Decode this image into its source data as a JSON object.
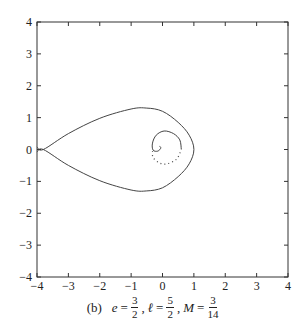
{
  "chart_data": {
    "type": "line",
    "title": "",
    "xlabel": "",
    "ylabel": "",
    "xlim": [
      -4,
      4
    ],
    "ylim": [
      -4,
      4
    ],
    "grid": false,
    "legend": null,
    "x_ticks": [
      "−4",
      "−3",
      "−2",
      "−1",
      "0",
      "1",
      "2",
      "3",
      "4"
    ],
    "y_ticks": [
      "4",
      "3",
      "2",
      "1",
      "0",
      "−1",
      "−2",
      "−3",
      "−4"
    ],
    "series": [
      {
        "name": "teardrop-orbit-solid",
        "style": "solid",
        "points": [
          [
            -4.0,
            0.08
          ],
          [
            -3.8,
            0.0
          ],
          [
            -3.0,
            0.5
          ],
          [
            -2.0,
            0.98
          ],
          [
            -1.0,
            1.27
          ],
          [
            -0.5,
            1.3
          ],
          [
            0.0,
            1.2
          ],
          [
            0.5,
            0.85
          ],
          [
            0.85,
            0.45
          ],
          [
            1.0,
            0.0
          ],
          [
            0.85,
            -0.45
          ],
          [
            0.5,
            -0.85
          ],
          [
            0.0,
            -1.2
          ],
          [
            -0.5,
            -1.3
          ],
          [
            -1.0,
            -1.27
          ],
          [
            -2.0,
            -0.98
          ],
          [
            -3.0,
            -0.5
          ],
          [
            -3.8,
            0.0
          ],
          [
            -4.0,
            -0.08
          ]
        ]
      },
      {
        "name": "inner-spiral-solid",
        "style": "solid",
        "points": [
          [
            0.6,
            0.0
          ],
          [
            0.55,
            0.3
          ],
          [
            0.35,
            0.5
          ],
          [
            0.05,
            0.58
          ],
          [
            -0.2,
            0.45
          ],
          [
            -0.32,
            0.2
          ],
          [
            -0.3,
            -0.02
          ],
          [
            -0.15,
            -0.05
          ],
          [
            -0.05,
            0.05
          ],
          [
            -0.1,
            0.1
          ]
        ]
      },
      {
        "name": "inner-spiral-dotted",
        "style": "dotted",
        "points": [
          [
            -0.32,
            -0.05
          ],
          [
            -0.3,
            -0.25
          ],
          [
            -0.1,
            -0.42
          ],
          [
            0.15,
            -0.45
          ],
          [
            0.45,
            -0.3
          ],
          [
            0.58,
            -0.05
          ]
        ]
      }
    ]
  },
  "caption": {
    "label": "(b)",
    "e_var": "e",
    "e_num": "3",
    "e_den": "2",
    "l_var": "ℓ",
    "l_num": "5",
    "l_den": "2",
    "m_var": "M",
    "m_num": "3",
    "m_den": "14",
    "equals": "=",
    "comma": ","
  }
}
